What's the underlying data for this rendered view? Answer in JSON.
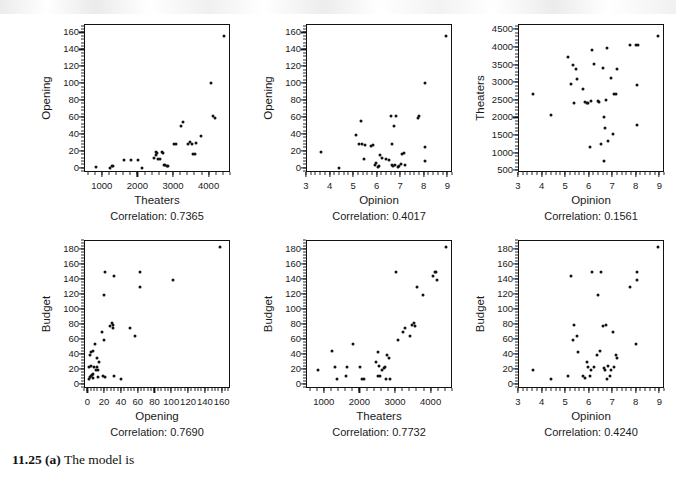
{
  "caption": {
    "number": "11.25 (a)",
    "text": "The model is"
  },
  "chart_data": [
    {
      "type": "scatter",
      "panel": "opening-vs-theaters",
      "title": "",
      "xlabel": "Theaters",
      "ylabel": "Opening",
      "annotation": "Correlation: 0.7365",
      "correlation": 0.7365,
      "xlim": [
        500,
        4600
      ],
      "ylim": [
        -5,
        170
      ],
      "xticks": [
        1000,
        2000,
        3000,
        4000
      ],
      "yticks": [
        0,
        20,
        40,
        60,
        80,
        100,
        120,
        140,
        160
      ],
      "grid": false,
      "x": [
        800,
        1200,
        1250,
        1300,
        1600,
        1800,
        2000,
        2100,
        2450,
        2500,
        2500,
        2520,
        2560,
        2600,
        2650,
        2700,
        2720,
        2760,
        2800,
        2820,
        3000,
        3050,
        3200,
        3250,
        3400,
        3450,
        3500,
        3520,
        3600,
        3620,
        3750,
        4050,
        4100,
        4150,
        4400
      ],
      "y": [
        2,
        1,
        3,
        3,
        10,
        10,
        10,
        1,
        13,
        16,
        20,
        19,
        12,
        11,
        20,
        19,
        5,
        4,
        3,
        3,
        29,
        29,
        50,
        55,
        29,
        32,
        29,
        18,
        18,
        31,
        39,
        101,
        62,
        60,
        157
      ]
    },
    {
      "type": "scatter",
      "panel": "opening-vs-opinion",
      "title": "",
      "xlabel": "Opinion",
      "ylabel": "Opening",
      "annotation": "Correlation: 0.4017",
      "correlation": 0.4017,
      "xlim": [
        3,
        9.2
      ],
      "ylim": [
        -5,
        170
      ],
      "xticks": [
        3,
        4,
        5,
        6,
        7,
        8,
        9
      ],
      "yticks": [
        0,
        20,
        40,
        60,
        80,
        100,
        120,
        140,
        160
      ],
      "grid": false,
      "x": [
        3.6,
        4.35,
        5.1,
        5.2,
        5.3,
        5.35,
        5.4,
        5.45,
        5.7,
        5.8,
        5.9,
        5.95,
        6.0,
        6.05,
        6.1,
        6.2,
        6.35,
        6.5,
        6.55,
        6.6,
        6.6,
        6.65,
        6.7,
        6.75,
        6.8,
        6.85,
        6.9,
        7.0,
        7.05,
        7.1,
        7.15,
        7.7,
        7.75,
        8.0,
        8.0,
        8.0,
        8.9
      ],
      "y": [
        20,
        1,
        40,
        29,
        57,
        29,
        12,
        28,
        27,
        28,
        5,
        7,
        2,
        3,
        16,
        13,
        12,
        10,
        62,
        29,
        5,
        3,
        51,
        4,
        62,
        2,
        3,
        6,
        18,
        19,
        5,
        60,
        62,
        26,
        9,
        101,
        157
      ]
    },
    {
      "type": "scatter",
      "panel": "theaters-vs-opinion",
      "title": "",
      "xlabel": "Opinion",
      "ylabel": "Theaters",
      "annotation": "Correlation: 0.1561",
      "correlation": 0.1561,
      "xlim": [
        3,
        9.2
      ],
      "ylim": [
        450,
        4650
      ],
      "xticks": [
        3,
        4,
        5,
        6,
        7,
        8,
        9
      ],
      "yticks": [
        500,
        1000,
        1500,
        2000,
        2500,
        3000,
        3500,
        4000,
        4500
      ],
      "grid": false,
      "x": [
        3.6,
        4.35,
        5.1,
        5.2,
        5.3,
        5.35,
        5.4,
        5.45,
        5.7,
        5.8,
        5.9,
        5.95,
        6.0,
        6.05,
        6.1,
        6.2,
        6.35,
        6.4,
        6.5,
        6.55,
        6.6,
        6.6,
        6.65,
        6.7,
        6.75,
        6.8,
        6.9,
        7.0,
        7.05,
        7.1,
        7.15,
        7.7,
        7.95,
        8.0,
        8.0,
        8.05,
        8.9
      ],
      "y": [
        2700,
        2100,
        3750,
        2970,
        3520,
        2430,
        3390,
        3110,
        2830,
        2460,
        2450,
        2430,
        1180,
        2480,
        3950,
        3550,
        2500,
        2470,
        1280,
        3440,
        800,
        2030,
        1720,
        2520,
        4000,
        1350,
        3150,
        1560,
        2700,
        2680,
        3400,
        4080,
        4070,
        1810,
        2960,
        4070,
        4330
      ]
    },
    {
      "type": "scatter",
      "panel": "budget-vs-opening",
      "title": "",
      "xlabel": "Opening",
      "ylabel": "Budget",
      "annotation": "Correlation: 0.7690",
      "correlation": 0.769,
      "xlim": [
        -4,
        170
      ],
      "ylim": [
        -6,
        192
      ],
      "xticks": [
        0,
        20,
        40,
        60,
        80,
        100,
        120,
        140,
        160
      ],
      "yticks": [
        0,
        20,
        40,
        60,
        80,
        100,
        120,
        140,
        160,
        180
      ],
      "grid": false,
      "x": [
        1,
        1,
        2,
        2,
        3,
        3,
        3,
        4,
        5,
        5,
        6,
        7,
        8,
        9,
        10,
        10,
        11,
        12,
        13,
        16,
        18,
        19,
        19,
        20,
        20,
        26,
        28,
        29,
        29,
        30,
        31,
        39,
        50,
        55,
        62,
        62,
        101,
        157
      ],
      "y": [
        8,
        24,
        10,
        40,
        12,
        25,
        44,
        13,
        9,
        45,
        14,
        24,
        54,
        20,
        24,
        35,
        10,
        19,
        30,
        70,
        12,
        60,
        120,
        150,
        10,
        78,
        82,
        80,
        76,
        145,
        11,
        8,
        75,
        65,
        130,
        150,
        140,
        184
      ]
    },
    {
      "type": "scatter",
      "panel": "budget-vs-theaters",
      "title": "",
      "xlabel": "Theaters",
      "ylabel": "Budget",
      "annotation": "Correlation: 0.7732",
      "correlation": 0.7732,
      "xlim": [
        500,
        4600
      ],
      "ylim": [
        -6,
        192
      ],
      "xticks": [
        1000,
        2000,
        3000,
        4000
      ],
      "yticks": [
        0,
        20,
        40,
        60,
        80,
        100,
        120,
        140,
        160,
        180
      ],
      "grid": false,
      "x": [
        800,
        1200,
        1300,
        1350,
        1600,
        1620,
        1800,
        2000,
        2050,
        2100,
        2450,
        2480,
        2500,
        2520,
        2550,
        2600,
        2650,
        2700,
        2720,
        2760,
        2800,
        2820,
        3000,
        3050,
        3200,
        3250,
        3400,
        3450,
        3500,
        3520,
        3600,
        3750,
        4050,
        4100,
        4120,
        4150,
        4400
      ],
      "y": [
        20,
        45,
        24,
        8,
        12,
        24,
        54,
        24,
        8,
        8,
        30,
        12,
        44,
        25,
        11,
        20,
        22,
        24,
        8,
        40,
        35,
        8,
        150,
        60,
        70,
        75,
        65,
        80,
        82,
        78,
        130,
        120,
        145,
        150,
        150,
        140,
        184
      ]
    },
    {
      "type": "scatter",
      "panel": "budget-vs-opinion",
      "title": "",
      "xlabel": "Opinion",
      "ylabel": "Budget",
      "annotation": "Correlation: 0.4240",
      "correlation": 0.424,
      "xlim": [
        3,
        9.2
      ],
      "ylim": [
        -6,
        192
      ],
      "xticks": [
        3,
        4,
        5,
        6,
        7,
        8,
        9
      ],
      "yticks": [
        0,
        20,
        40,
        60,
        80,
        100,
        120,
        140,
        160,
        180
      ],
      "grid": false,
      "x": [
        3.6,
        4.35,
        5.1,
        5.2,
        5.3,
        5.35,
        5.45,
        5.5,
        5.7,
        5.8,
        5.9,
        5.95,
        6.0,
        6.05,
        6.1,
        6.2,
        6.3,
        6.35,
        6.45,
        6.5,
        6.55,
        6.6,
        6.65,
        6.7,
        6.75,
        6.8,
        6.85,
        6.9,
        7.0,
        7.05,
        7.1,
        7.15,
        7.7,
        7.95,
        8.0,
        8.0,
        8.9
      ],
      "y": [
        20,
        8,
        12,
        145,
        60,
        80,
        65,
        44,
        11,
        9,
        30,
        24,
        12,
        20,
        150,
        24,
        40,
        120,
        45,
        150,
        78,
        22,
        20,
        80,
        8,
        25,
        11,
        20,
        70,
        24,
        40,
        36,
        130,
        54,
        150,
        140,
        184
      ]
    }
  ]
}
